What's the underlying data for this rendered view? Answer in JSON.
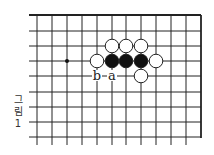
{
  "diagram": {
    "type": "go-board",
    "grid": {
      "x_lines": [
        37,
        52,
        67,
        82,
        97,
        112,
        126,
        141,
        156,
        171,
        186,
        201
      ],
      "y_lines": [
        15,
        31,
        46,
        61,
        76,
        92,
        107,
        122,
        137
      ],
      "left_extent": 29,
      "bottom_extent": 145,
      "top_edge": true,
      "right_edge": true
    },
    "star_points": [
      {
        "col": 2,
        "row": 3
      }
    ],
    "stones": [
      {
        "color": "white",
        "col": 5,
        "row": 2
      },
      {
        "color": "white",
        "col": 6,
        "row": 2
      },
      {
        "color": "white",
        "col": 7,
        "row": 2
      },
      {
        "color": "white",
        "col": 4,
        "row": 3
      },
      {
        "color": "black",
        "col": 5,
        "row": 3
      },
      {
        "color": "black",
        "col": 6,
        "row": 3
      },
      {
        "color": "black",
        "col": 7,
        "row": 3
      },
      {
        "color": "white",
        "col": 8,
        "row": 3
      },
      {
        "color": "white",
        "col": 7,
        "row": 4
      }
    ],
    "labels": [
      {
        "text": "b",
        "col": 4,
        "row": 4
      },
      {
        "text": "a",
        "col": 5,
        "row": 4
      }
    ],
    "caption": [
      "그",
      "림",
      "1"
    ]
  }
}
